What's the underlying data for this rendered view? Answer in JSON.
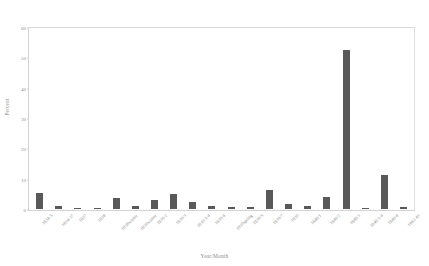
{
  "chart_data": {
    "type": "bar",
    "title": "",
    "xlabel": "Year/Month",
    "ylabel": "Percent",
    "ylim": [
      0,
      60
    ],
    "yticks": [
      0,
      10,
      20,
      30,
      40,
      50,
      60
    ],
    "grid": false,
    "legend": null,
    "bar_color": "#595959",
    "axis_color": "#d4d4d4",
    "text_color": "#8d8d8d",
    "categories": [
      "1834-5",
      "1834-37",
      "1837",
      "1838",
      "1838winter",
      "1839winter",
      "1839/2",
      "1839/3",
      "1839/3-4",
      "1839/4",
      "1839spring",
      "1839/5",
      "1839/7",
      "1839",
      "1840/1",
      "1840/2",
      "1840/3",
      "1840/3-4",
      "1840/4",
      "1842-43"
    ],
    "values": [
      5.2,
      1.1,
      0.5,
      0.4,
      3.6,
      1.0,
      3.1,
      4.9,
      2.3,
      1.0,
      0.7,
      0.6,
      6.5,
      1.7,
      1.1,
      4.0,
      53.0,
      0.5,
      11.2,
      0.6
    ]
  }
}
